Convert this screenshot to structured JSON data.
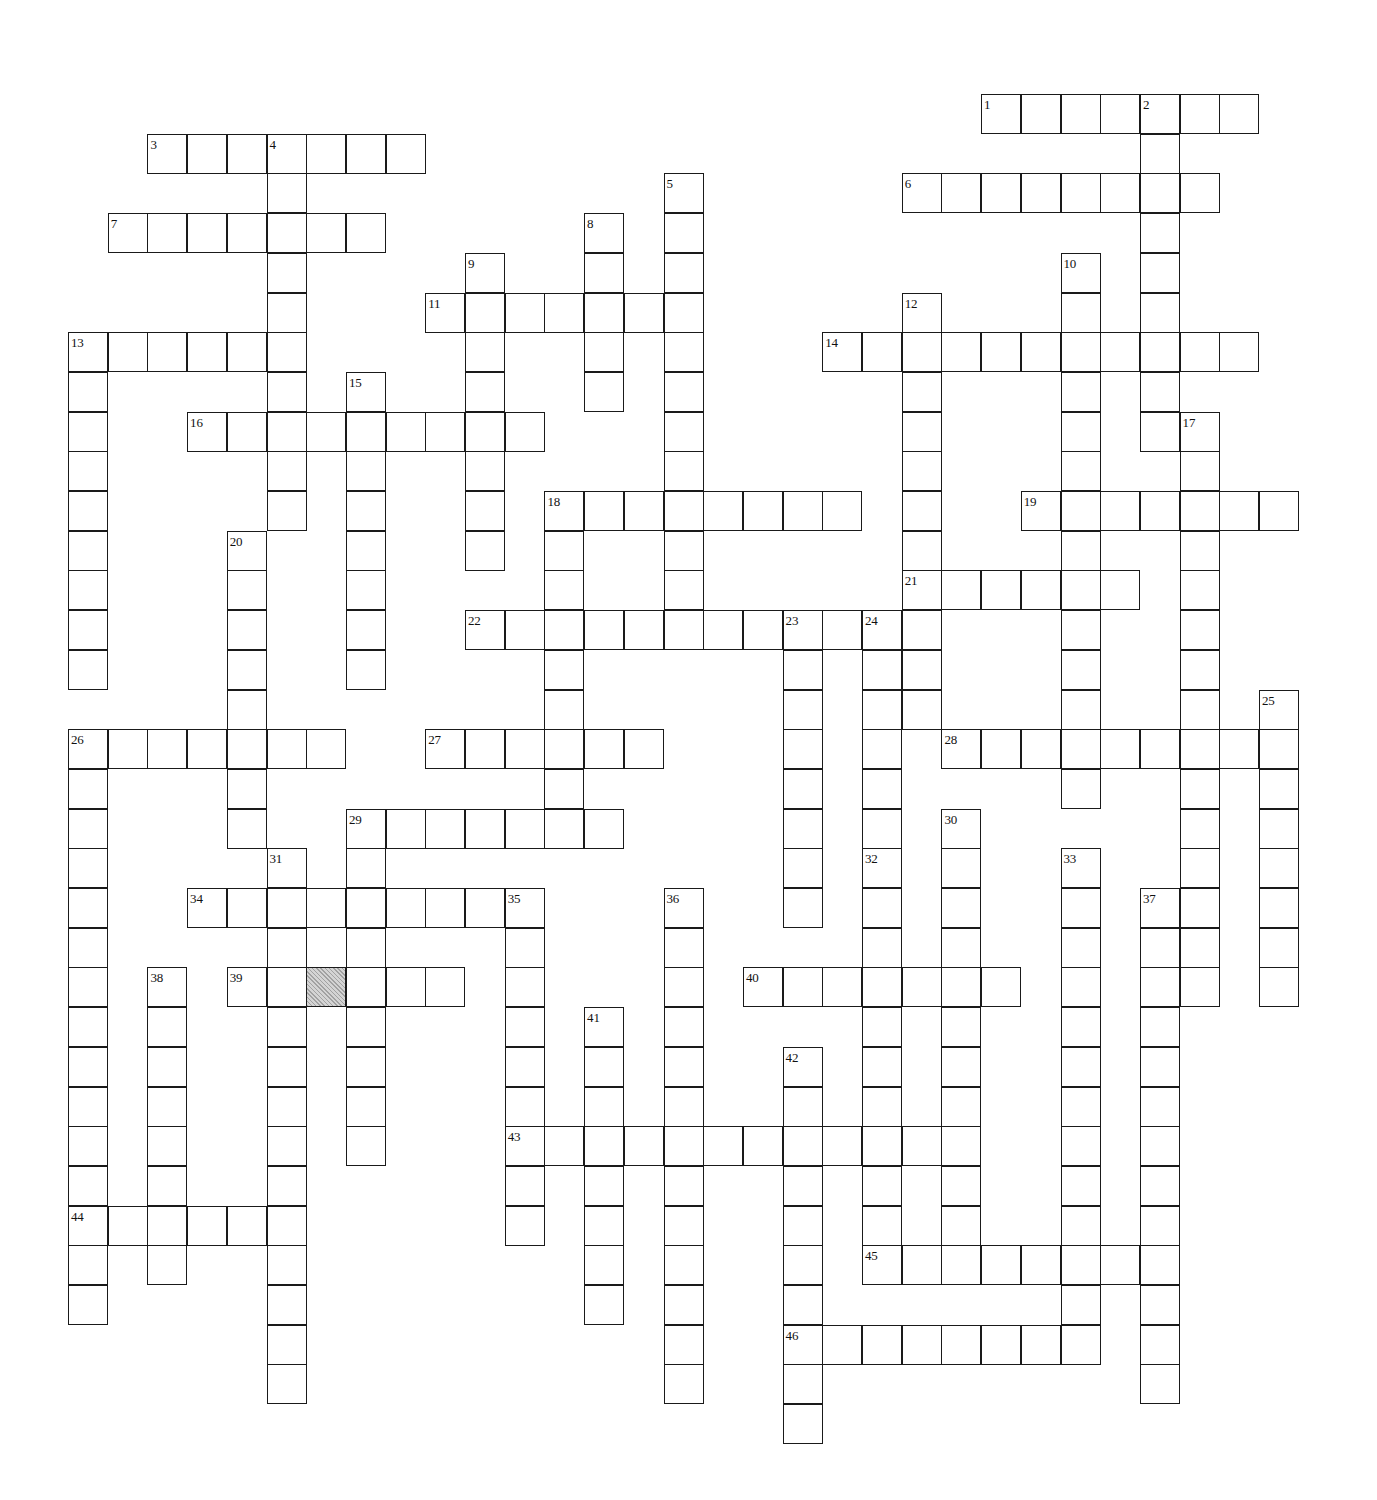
{
  "puzzle": {
    "title": "Crossword Puzzle Grid",
    "type": "freeform-crossword",
    "grid": {
      "origin_x": 68,
      "origin_y": 94,
      "cell_size": 39.7,
      "cols": 33,
      "rows": 36,
      "cell_fill": "#ffffff",
      "cell_border": "#1a1a1a",
      "shaded_fill": "#d4d4d4"
    },
    "shaded_cells": [
      {
        "col": 6,
        "row": 22
      }
    ],
    "entries": [
      {
        "number": "1",
        "direction": "across",
        "col": 23,
        "row": 0,
        "length": 7
      },
      {
        "number": "2",
        "direction": "down",
        "col": 27,
        "row": 0,
        "length": 9
      },
      {
        "number": "3",
        "direction": "across",
        "col": 2,
        "row": 1,
        "length": 7
      },
      {
        "number": "4",
        "direction": "down",
        "col": 5,
        "row": 1,
        "length": 10
      },
      {
        "number": "5",
        "direction": "down",
        "col": 15,
        "row": 2,
        "length": 11
      },
      {
        "number": "6",
        "direction": "across",
        "col": 21,
        "row": 2,
        "length": 8
      },
      {
        "number": "7",
        "direction": "across",
        "col": 1,
        "row": 3,
        "length": 7
      },
      {
        "number": "8",
        "direction": "down",
        "col": 13,
        "row": 3,
        "length": 5
      },
      {
        "number": "9",
        "direction": "down",
        "col": 10,
        "row": 4,
        "length": 8
      },
      {
        "number": "10",
        "direction": "down",
        "col": 25,
        "row": 4,
        "length": 14
      },
      {
        "number": "11",
        "direction": "across",
        "col": 9,
        "row": 5,
        "length": 6
      },
      {
        "number": "12",
        "direction": "down",
        "col": 21,
        "row": 5,
        "length": 11
      },
      {
        "number": "13",
        "direction": "across",
        "col": 0,
        "row": 6,
        "length": 6
      },
      {
        "number": "13",
        "direction": "down",
        "col": 0,
        "row": 6,
        "length": 9,
        "shared": true
      },
      {
        "number": "14",
        "direction": "across",
        "col": 19,
        "row": 6,
        "length": 11
      },
      {
        "number": "15",
        "direction": "down",
        "col": 7,
        "row": 7,
        "length": 8
      },
      {
        "number": "16",
        "direction": "across",
        "col": 3,
        "row": 8,
        "length": 9
      },
      {
        "number": "17",
        "direction": "down",
        "col": 28,
        "row": 8,
        "length": 15
      },
      {
        "number": "18",
        "direction": "across",
        "col": 12,
        "row": 10,
        "length": 8
      },
      {
        "number": "18",
        "direction": "down",
        "col": 12,
        "row": 10,
        "length": 8,
        "shared": true
      },
      {
        "number": "19",
        "direction": "across",
        "col": 24,
        "row": 10,
        "length": 7
      },
      {
        "number": "20",
        "direction": "down",
        "col": 4,
        "row": 11,
        "length": 8
      },
      {
        "number": "21",
        "direction": "across",
        "col": 21,
        "row": 12,
        "length": 6
      },
      {
        "number": "22",
        "direction": "across",
        "col": 10,
        "row": 13,
        "length": 12
      },
      {
        "number": "23",
        "direction": "down",
        "col": 18,
        "row": 13,
        "length": 8
      },
      {
        "number": "24",
        "direction": "down",
        "col": 20,
        "row": 13,
        "length": 8
      },
      {
        "number": "25",
        "direction": "down",
        "col": 30,
        "row": 15,
        "length": 8
      },
      {
        "number": "26",
        "direction": "across",
        "col": 0,
        "row": 16,
        "length": 7
      },
      {
        "number": "26",
        "direction": "down",
        "col": 0,
        "row": 16,
        "length": 15,
        "shared": true
      },
      {
        "number": "27",
        "direction": "across",
        "col": 9,
        "row": 16,
        "length": 6
      },
      {
        "number": "28",
        "direction": "across",
        "col": 22,
        "row": 16,
        "length": 9
      },
      {
        "number": "29",
        "direction": "across",
        "col": 7,
        "row": 18,
        "length": 7
      },
      {
        "number": "29",
        "direction": "down",
        "col": 7,
        "row": 18,
        "length": 9,
        "shared": true
      },
      {
        "number": "30",
        "direction": "down",
        "col": 22,
        "row": 18,
        "length": 11
      },
      {
        "number": "31",
        "direction": "down",
        "col": 5,
        "row": 19,
        "length": 14
      },
      {
        "number": "32",
        "direction": "down",
        "col": 20,
        "row": 19,
        "length": 11
      },
      {
        "number": "33",
        "direction": "down",
        "col": 25,
        "row": 19,
        "length": 13
      },
      {
        "number": "34",
        "direction": "across",
        "col": 3,
        "row": 20,
        "length": 8
      },
      {
        "number": "35",
        "direction": "down",
        "col": 11,
        "row": 20,
        "length": 9
      },
      {
        "number": "36",
        "direction": "down",
        "col": 15,
        "row": 20,
        "length": 13
      },
      {
        "number": "37",
        "direction": "down",
        "col": 27,
        "row": 20,
        "length": 13
      },
      {
        "number": "38",
        "direction": "down",
        "col": 2,
        "row": 22,
        "length": 8
      },
      {
        "number": "39",
        "direction": "across",
        "col": 4,
        "row": 22,
        "length": 6
      },
      {
        "number": "40",
        "direction": "across",
        "col": 17,
        "row": 22,
        "length": 7
      },
      {
        "number": "41",
        "direction": "down",
        "col": 13,
        "row": 23,
        "length": 8
      },
      {
        "number": "42",
        "direction": "down",
        "col": 18,
        "row": 24,
        "length": 10
      },
      {
        "number": "43",
        "direction": "across",
        "col": 11,
        "row": 26,
        "length": 11
      },
      {
        "number": "44",
        "direction": "across",
        "col": 0,
        "row": 28,
        "length": 6
      },
      {
        "number": "45",
        "direction": "across",
        "col": 20,
        "row": 29,
        "length": 8
      },
      {
        "number": "46",
        "direction": "across",
        "col": 18,
        "row": 31,
        "length": 8
      }
    ]
  }
}
